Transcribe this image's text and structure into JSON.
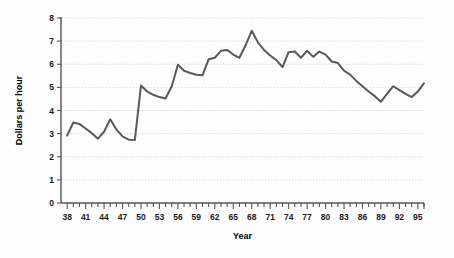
{
  "chart_data": {
    "type": "line",
    "title": "",
    "xlabel": "Year",
    "ylabel": "Dollars per hour",
    "xlim": [
      37,
      96
    ],
    "ylim": [
      0,
      8
    ],
    "grid": true,
    "legend": false,
    "line_color": "#595959",
    "x_tick_labels": [
      "38",
      "41",
      "44",
      "47",
      "50",
      "53",
      "56",
      "59",
      "62",
      "65",
      "68",
      "71",
      "74",
      "77",
      "80",
      "83",
      "86",
      "89",
      "92",
      "95"
    ],
    "x_tick_values": [
      38,
      41,
      44,
      47,
      50,
      53,
      56,
      59,
      62,
      65,
      68,
      71,
      74,
      77,
      80,
      83,
      86,
      89,
      92,
      95
    ],
    "x_minor_ticks_every": 1,
    "y_tick_labels": [
      "0",
      "1",
      "2",
      "3",
      "4",
      "5",
      "6",
      "7",
      "8"
    ],
    "y_tick_values": [
      0,
      1,
      2,
      3,
      4,
      5,
      6,
      7,
      8
    ],
    "x": [
      38,
      39,
      40,
      41,
      42,
      43,
      44,
      45,
      46,
      47,
      48,
      49,
      50,
      51,
      52,
      53,
      54,
      55,
      56,
      57,
      58,
      59,
      60,
      61,
      62,
      63,
      64,
      65,
      66,
      67,
      68,
      69,
      70,
      71,
      72,
      73,
      74,
      75,
      76,
      77,
      78,
      79,
      80,
      81,
      82,
      83,
      84,
      85,
      86,
      87,
      88,
      89,
      90,
      91,
      92,
      93,
      94,
      95,
      96
    ],
    "values": [
      2.92,
      3.48,
      3.42,
      3.22,
      3.02,
      2.78,
      3.08,
      3.62,
      3.18,
      2.88,
      2.74,
      2.72,
      5.08,
      4.82,
      4.68,
      4.58,
      4.52,
      5.05,
      5.98,
      5.72,
      5.62,
      5.55,
      5.52,
      6.22,
      6.28,
      6.58,
      6.62,
      6.42,
      6.28,
      6.82,
      7.45,
      6.95,
      6.62,
      6.38,
      6.18,
      5.88,
      6.52,
      6.55,
      6.28,
      6.58,
      6.32,
      6.55,
      6.42,
      6.12,
      6.05,
      5.72,
      5.55,
      5.28,
      5.05,
      4.82,
      4.62,
      4.38,
      4.72,
      5.05,
      4.88,
      4.72,
      4.58,
      4.82,
      5.18
    ]
  }
}
